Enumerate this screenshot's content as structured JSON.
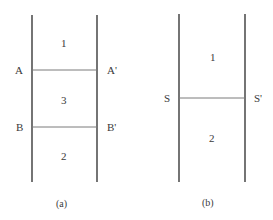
{
  "diagrams": [
    {
      "id": "a",
      "caption": "(a)",
      "regions": [
        "1",
        "3",
        "2"
      ],
      "interfaces": [
        {
          "left": "A",
          "right": "A'"
        },
        {
          "left": "B",
          "right": "B'"
        }
      ]
    },
    {
      "id": "b",
      "caption": "(b)",
      "regions": [
        "1",
        "2"
      ],
      "interfaces": [
        {
          "left": "S",
          "right": "S'"
        }
      ]
    }
  ],
  "colors": {
    "line": "#2a2a2a",
    "interface_line": "#7a7a7a",
    "text": "#3a3a3a"
  }
}
